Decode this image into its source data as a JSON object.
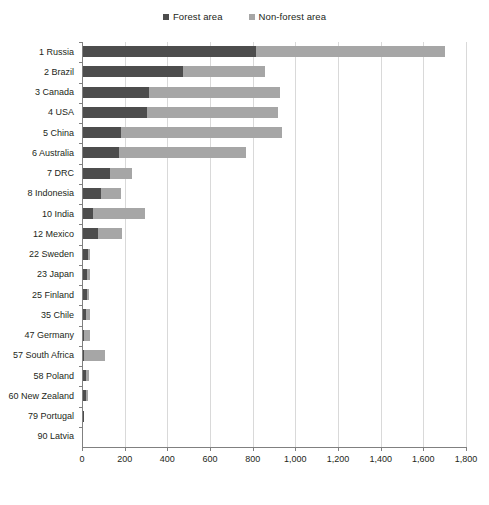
{
  "chart_data": {
    "type": "bar",
    "orientation": "horizontal",
    "stacked": true,
    "title": "",
    "xlabel": "Million hectares",
    "ylabel": "",
    "xlim": [
      0,
      1800
    ],
    "xticks": [
      0,
      200,
      400,
      600,
      800,
      1000,
      1200,
      1400,
      1600,
      1800
    ],
    "xtick_labels": [
      "0",
      "200",
      "400",
      "600",
      "800",
      "1,000",
      "1,200",
      "1,400",
      "1,600",
      "1,800"
    ],
    "grid": true,
    "legend_position": "top-center",
    "categories": [
      "1 Russia",
      "2 Brazil",
      "3 Canada",
      "4 USA",
      "5 China",
      "6 Australia",
      "7 DRC",
      "8 Indonesia",
      "10 India",
      "12 Mexico",
      "22 Sweden",
      "23 Japan",
      "25 Finland",
      "35 Chile",
      "47 Germany",
      "57 South Africa",
      "58 Poland",
      "60 New Zealand",
      "79 Portugal",
      "90 Latvia"
    ],
    "series": [
      {
        "name": "Forest area",
        "color": "#4d4d4d",
        "values": [
          815,
          473,
          314,
          305,
          183,
          173,
          131,
          89,
          52,
          75,
          28,
          25,
          23,
          18,
          11,
          9,
          21,
          21,
          9,
          7
        ]
      },
      {
        "name": "Non-forest area",
        "color": "#a6a6a6",
        "values": [
          887,
          385,
          614,
          614,
          754,
          596,
          103,
          94,
          243,
          112,
          10,
          13,
          10,
          20,
          25,
          99,
          10,
          6,
          0,
          0
        ]
      }
    ],
    "totals": [
      1702,
      858,
      928,
      919,
      937,
      769,
      234,
      183,
      295,
      187,
      38,
      38,
      33,
      38,
      36,
      108,
      31,
      27,
      9,
      7
    ]
  },
  "legend": {
    "items": [
      {
        "label": "Forest area",
        "color": "#4d4d4d"
      },
      {
        "label": "Non-forest area",
        "color": "#a6a6a6"
      }
    ]
  },
  "axis": {
    "x_title": "Million hectares",
    "tick_labels": [
      "0",
      "200",
      "400",
      "600",
      "800",
      "1,000",
      "1,200",
      "1,400",
      "1,600",
      "1,800"
    ]
  },
  "colors": {
    "forest": "#4d4d4d",
    "non_forest": "#a6a6a6",
    "grid": "#d9d9d9",
    "axis": "#808080",
    "text": "#231f20",
    "background": "#ffffff"
  }
}
